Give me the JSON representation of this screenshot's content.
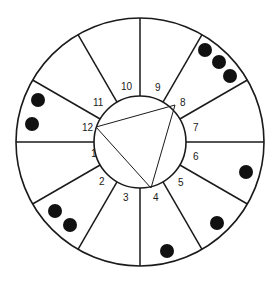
{
  "diagram": {
    "type": "circular-sector-diagram",
    "background": "#ffffff",
    "stroke_color": "#1a1a1a",
    "dot_color": "#111111",
    "center": [
      140,
      142
    ],
    "outer_radius": 124,
    "inner_radius": 46,
    "sections": [
      {
        "id": "1",
        "label": "1",
        "label_pos": [
          91,
          157
        ],
        "dots": 0
      },
      {
        "id": "2",
        "label": "2",
        "label_pos": [
          99,
          185
        ],
        "dots": 2
      },
      {
        "id": "3",
        "label": "3",
        "label_pos": [
          123,
          201
        ],
        "dots": 0
      },
      {
        "id": "4",
        "label": "4",
        "label_pos": [
          153,
          201
        ],
        "dots": 1
      },
      {
        "id": "5",
        "label": "5",
        "label_pos": [
          178,
          186
        ],
        "dots": 1
      },
      {
        "id": "6",
        "label": "6",
        "label_pos": [
          193,
          160
        ],
        "dots": 1
      },
      {
        "id": "7",
        "label": "7",
        "label_pos": [
          193,
          131
        ],
        "dots": 0
      },
      {
        "id": "8",
        "label": "8",
        "label_pos": [
          180,
          106
        ],
        "dots": 3
      },
      {
        "id": "9",
        "label": "9",
        "label_pos": [
          155,
          91
        ],
        "dots": 0
      },
      {
        "id": "10",
        "label": "10",
        "label_pos": [
          121,
          90
        ],
        "dots": 0
      },
      {
        "id": "11",
        "label": "11",
        "label_pos": [
          93,
          106
        ],
        "dots": 0
      },
      {
        "id": "12",
        "label": "12",
        "label_pos": [
          82,
          131
        ],
        "dots": 2
      }
    ],
    "dots": [
      {
        "section": "12",
        "cx": 38,
        "cy": 100,
        "r": 7
      },
      {
        "section": "12",
        "cx": 32,
        "cy": 124,
        "r": 7
      },
      {
        "section": "8",
        "cx": 205,
        "cy": 50,
        "r": 7
      },
      {
        "section": "8",
        "cx": 219,
        "cy": 62,
        "r": 7
      },
      {
        "section": "8",
        "cx": 230,
        "cy": 76,
        "r": 7
      },
      {
        "section": "6",
        "cx": 246,
        "cy": 172,
        "r": 7
      },
      {
        "section": "5",
        "cx": 217,
        "cy": 223,
        "r": 7
      },
      {
        "section": "4",
        "cx": 167,
        "cy": 251,
        "r": 7
      },
      {
        "section": "2",
        "cx": 55,
        "cy": 211,
        "r": 7
      },
      {
        "section": "2",
        "cx": 70,
        "cy": 225,
        "r": 7
      }
    ],
    "triangle": {
      "vertices": [
        "12",
        "8",
        "4"
      ],
      "points": [
        [
          96,
          127
        ],
        [
          175,
          105
        ],
        [
          151,
          188
        ]
      ]
    }
  }
}
